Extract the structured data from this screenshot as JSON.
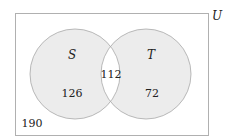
{
  "diagram": {
    "type": "venn",
    "universe_label": "U",
    "sets": [
      {
        "name": "S",
        "only_count": "126"
      },
      {
        "name": "T",
        "only_count": "72"
      }
    ],
    "intersection_count": "112",
    "outside_count": "190",
    "colors": {
      "circle_fill": "#ececec",
      "circle_stroke": "#a8a8a8",
      "frame_stroke": "#b0b0b0",
      "intersection_fill": "#ffffff"
    }
  }
}
